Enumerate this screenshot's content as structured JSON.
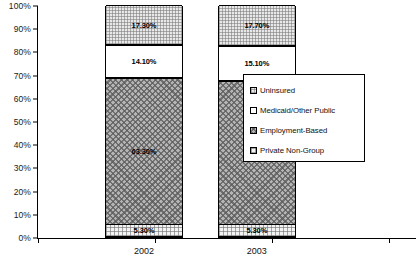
{
  "chart_data": {
    "type": "bar",
    "subtype": "stacked-100-percent",
    "title": "",
    "xlabel": "",
    "ylabel": "",
    "categories": [
      "2002",
      "2003"
    ],
    "ylim": [
      0,
      100
    ],
    "ytick_labels": [
      "0%",
      "10%",
      "20%",
      "30%",
      "40%",
      "50%",
      "60%",
      "70%",
      "80%",
      "90%",
      "100%"
    ],
    "ytick_values": [
      0,
      10,
      20,
      30,
      40,
      50,
      60,
      70,
      80,
      90,
      100
    ],
    "grid": false,
    "legend_position": "right",
    "series": [
      {
        "name": "Private Non-Group",
        "fill": "fill-private",
        "values": [
          5.3,
          5.3
        ],
        "labels": [
          "5.30%",
          "5.30%"
        ]
      },
      {
        "name": "Employment-Based",
        "fill": "fill-employment",
        "values": [
          63.3,
          61.9
        ],
        "labels": [
          "63.30%",
          "61.90%"
        ]
      },
      {
        "name": "Medicaid/Other Public",
        "fill": "fill-medicaid",
        "values": [
          14.1,
          15.1
        ],
        "labels": [
          "14.10%",
          "15.10%"
        ]
      },
      {
        "name": "Uninsured",
        "fill": "fill-uninsured",
        "values": [
          17.3,
          17.7
        ],
        "labels": [
          "17.30%",
          "17.70%"
        ]
      }
    ],
    "legend_order": [
      "Uninsured",
      "Medicaid/Other Public",
      "Employment-Based",
      "Private Non-Group"
    ]
  }
}
